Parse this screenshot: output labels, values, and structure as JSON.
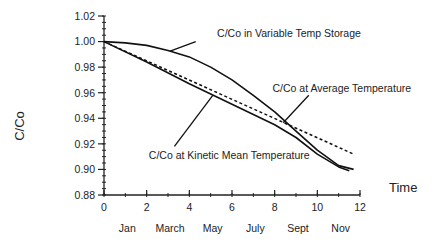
{
  "chart_data": {
    "type": "line",
    "title": "",
    "xlabel": "Time",
    "ylabel": "C/Co",
    "xlim": [
      0,
      12
    ],
    "ylim": [
      0.88,
      1.02
    ],
    "x_ticks": [
      0,
      2,
      4,
      6,
      8,
      10,
      12
    ],
    "x_tick_labels": [
      "0",
      "2",
      "4",
      "6",
      "8",
      "10",
      "12"
    ],
    "y_ticks": [
      0.88,
      0.9,
      0.92,
      0.94,
      0.96,
      0.98,
      1.0,
      1.02
    ],
    "y_tick_labels": [
      "0.88",
      "0.90",
      "0.92",
      "0.94",
      "0.96",
      "0.98",
      "1.00",
      "1.02"
    ],
    "month_labels": [
      {
        "x": 1,
        "label": "Jan"
      },
      {
        "x": 3,
        "label": "March"
      },
      {
        "x": 5,
        "label": "May"
      },
      {
        "x": 7,
        "label": "July"
      },
      {
        "x": 9,
        "label": "Sept"
      },
      {
        "x": 11,
        "label": "Nov"
      }
    ],
    "grid": false,
    "series": [
      {
        "name": "C/Co in Variable Temp Storage",
        "style": "solid",
        "x": [
          0,
          1,
          2,
          3,
          4,
          5,
          6,
          7,
          8,
          9,
          10,
          11,
          11.7
        ],
        "values": [
          1.0,
          0.999,
          0.997,
          0.993,
          0.988,
          0.98,
          0.97,
          0.958,
          0.945,
          0.93,
          0.915,
          0.903,
          0.9
        ]
      },
      {
        "name": "C/Co at Average Temperature",
        "style": "dashed",
        "x": [
          0,
          11.7
        ],
        "values": [
          1.0,
          0.912
        ]
      },
      {
        "name": "C/Co at Kinetic Mean Temperature",
        "style": "solid",
        "x": [
          0,
          2,
          4,
          6,
          8,
          9,
          10,
          11,
          11.5
        ],
        "values": [
          1.0,
          0.984,
          0.967,
          0.951,
          0.935,
          0.925,
          0.912,
          0.902,
          0.899
        ]
      }
    ],
    "annotations": [
      {
        "text": "C/Co in Variable Temp Storage",
        "series": 0,
        "text_x": 5.3,
        "text_y": 1.0035,
        "pointer_from": [
          4.3,
          1.0
        ],
        "pointer_to": [
          3.1,
          0.9925
        ]
      },
      {
        "text": "C/Co at Average Temperature",
        "series": 1,
        "text_x": 7.9,
        "text_y": 0.9605,
        "pointer_from": [
          9.6,
          0.958
        ],
        "pointer_to": [
          8.4,
          0.9365
        ]
      },
      {
        "text": "C/Co at Kinetic Mean Temperature",
        "series": 2,
        "text_x": 2.1,
        "text_y": 0.9085,
        "pointer_from": [
          3.3,
          0.918
        ],
        "pointer_to": [
          5.1,
          0.958
        ]
      }
    ]
  }
}
